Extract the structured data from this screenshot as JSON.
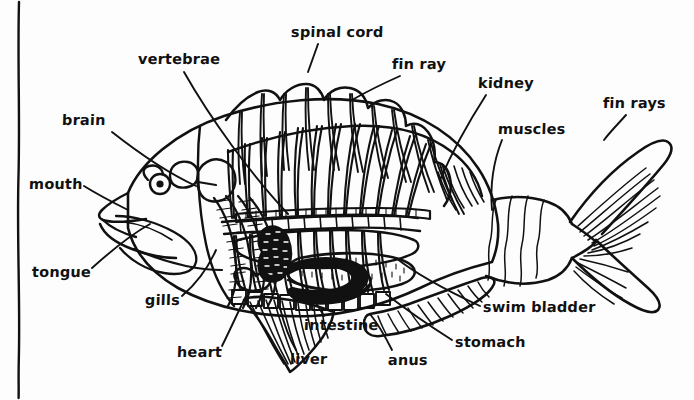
{
  "diagram": {
    "style": "black ink line drawing on white paper",
    "background_color": "#fdfdfd",
    "ink_color": "#111111",
    "border": {
      "name": "left-hand-drawn-margin-line",
      "orientation": "vertical",
      "x": 18
    },
    "labels": [
      {
        "id": "spinal-cord",
        "text": "spinal cord",
        "x": 291,
        "y": 25,
        "leader": "down-right to spine top"
      },
      {
        "id": "vertebrae",
        "text": "vertebrae",
        "x": 138,
        "y": 52,
        "leader": "down-right to vertebral column"
      },
      {
        "id": "fin-ray",
        "text": "fin ray",
        "x": 392,
        "y": 57,
        "leader": "down-left to dorsal fin ray"
      },
      {
        "id": "kidney",
        "text": "kidney",
        "x": 478,
        "y": 76,
        "leader": "down-left to kidney band"
      },
      {
        "id": "fin-rays",
        "text": "fin rays",
        "x": 603,
        "y": 96,
        "leader": "down-left to caudal fin"
      },
      {
        "id": "brain",
        "text": "brain",
        "x": 62,
        "y": 113,
        "leader": "down-right to cranium"
      },
      {
        "id": "muscles",
        "text": "muscles",
        "x": 498,
        "y": 122,
        "leader": "down-left to caudal peduncle muscle"
      },
      {
        "id": "mouth",
        "text": "mouth",
        "x": 29,
        "y": 177,
        "leader": "right to jaw"
      },
      {
        "id": "tongue",
        "text": "tongue",
        "x": 32,
        "y": 265,
        "leader": "up-right to tongue"
      },
      {
        "id": "gills",
        "text": "gills",
        "x": 145,
        "y": 293,
        "leader": "up-right to gill arches"
      },
      {
        "id": "intestine",
        "text": "intestine",
        "x": 304,
        "y": 318,
        "leader": "up-left to intestine coil"
      },
      {
        "id": "swim-bladder",
        "text": "swim bladder",
        "x": 483,
        "y": 300,
        "leader": "up-left to swim bladder"
      },
      {
        "id": "heart",
        "text": "heart",
        "x": 177,
        "y": 345,
        "leader": "up-right to heart"
      },
      {
        "id": "stomach",
        "text": "stomach",
        "x": 455,
        "y": 335,
        "leader": "up-left to stomach"
      },
      {
        "id": "liver",
        "text": "liver",
        "x": 290,
        "y": 352,
        "leader": "up-right to liver"
      },
      {
        "id": "anus",
        "text": "anus",
        "x": 388,
        "y": 353,
        "leader": "up-left to vent"
      }
    ]
  }
}
